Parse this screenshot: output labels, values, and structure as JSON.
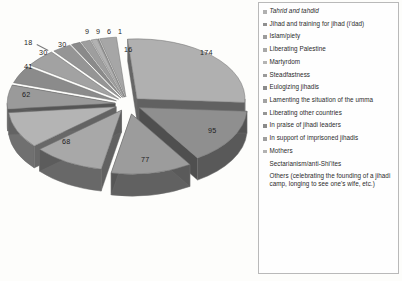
{
  "chart_data": {
    "type": "pie",
    "title": "",
    "subtitle": "",
    "xlabel": "",
    "ylabel": "",
    "legend_position": "right",
    "exploded": true,
    "three_d": true,
    "grid": false,
    "categories": [
      "Tahrid and tahdid",
      "Jihad and training for jihad (i'dad)",
      "Islam/piety",
      "Liberating Palestine",
      "Martyrdom",
      "Steadfastness",
      "Eulogizing jihadis",
      "Lamenting the situation of the umma",
      "Liberating other countries",
      "In praise of jihadi leaders",
      "In support of imprisoned jihadis",
      "Mothers",
      "Sectarianism/anti-Shi'ites",
      "Others (celebrating the founding of a jihadi camp, longing to see one's wife, etc.)"
    ],
    "values": [
      174,
      95,
      77,
      68,
      62,
      41,
      30,
      30,
      18,
      9,
      9,
      6,
      1,
      16
    ],
    "data_labels": [
      "174",
      "95",
      "77",
      "68",
      "62",
      "41",
      "30",
      "30",
      "18",
      "9",
      "9",
      "6",
      "1",
      "16"
    ],
    "colors": [
      "#b0b0b0",
      "#8f8f8f",
      "#9c9c9c",
      "#a8a8a8",
      "#b4b4b4",
      "#9a9a9a",
      "#8b8b8b",
      "#a2a2a2",
      "#959595",
      "#8a8a8a",
      "#9e9e9e",
      "#b2b2b2",
      "#8d8d8d",
      "#a6a6a6"
    ]
  },
  "legend": {
    "items": [
      {
        "label": "Tahrid and tahdid",
        "swatch": "#b0b0b0",
        "italic": true
      },
      {
        "label": "Jihad and training for jihad (i'dad)",
        "swatch": "#8f8f8f",
        "italic": false
      },
      {
        "label": "Islam/piety",
        "swatch": "#9c9c9c",
        "italic": false
      },
      {
        "label": "Liberating Palestine",
        "swatch": "#a8a8a8",
        "italic": false
      },
      {
        "label": "Martyrdom",
        "swatch": "#b4b4b4",
        "italic": false
      },
      {
        "label": "Steadfastness",
        "swatch": "#9a9a9a",
        "italic": false
      },
      {
        "label": "Eulogizing jihadis",
        "swatch": "#8b8b8b",
        "italic": false
      },
      {
        "label": "Lamenting the situation of the umma",
        "swatch": "#a2a2a2",
        "italic": false
      },
      {
        "label": "Liberating other countries",
        "swatch": "#959595",
        "italic": false
      },
      {
        "label": "In praise of jihadi leaders",
        "swatch": "#8a8a8a",
        "italic": false
      },
      {
        "label": "In support of imprisoned jihadis",
        "swatch": "#9e9e9e",
        "italic": false
      },
      {
        "label": "Mothers",
        "swatch": "#b2b2b2",
        "italic": false
      },
      {
        "label": "Sectarianism/anti-Shi'ites",
        "swatch": "#ffffff",
        "italic": false
      },
      {
        "label": "Others (celebrating the founding of a jihadi camp, longing to see one's wife, etc.)",
        "swatch": "#ffffff",
        "italic": false
      }
    ]
  }
}
